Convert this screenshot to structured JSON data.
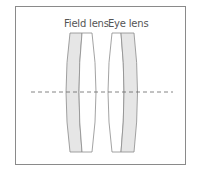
{
  "diagram": {
    "type": "optical-eyepiece",
    "labels": {
      "field_lens": "Field lens",
      "eye_lens": "Eye lens"
    },
    "elements": [
      {
        "name": "field-lens",
        "shape": "plano-convex with gray crown/flint element on left"
      },
      {
        "name": "eye-lens",
        "shape": "convex with gray element on right"
      },
      {
        "name": "optical-axis",
        "style": "dashed"
      }
    ],
    "colors": {
      "frame": "#8a8a8a",
      "lens_fill_gray": "#e6e6e6",
      "lens_outline": "#8c8c8c",
      "axis": "#666666",
      "label": "#555555"
    }
  }
}
